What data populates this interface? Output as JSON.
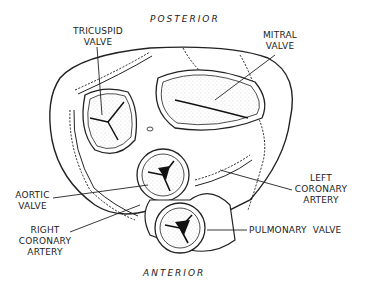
{
  "diagram": {
    "orientation": {
      "top": "POSTERIOR",
      "bottom": "ANTERIOR"
    },
    "labels": {
      "tricuspid": [
        "TRICUSPID",
        "VALVE"
      ],
      "mitral": [
        "MITRAL",
        "VALVE"
      ],
      "aortic": [
        "AORTIC",
        "VALVE"
      ],
      "left_coronary": [
        "LEFT",
        "CORONARY",
        "ARTERY"
      ],
      "right_coronary": [
        "RIGHT",
        "CORONARY",
        "ARTERY"
      ],
      "pulmonary": "PULMONARY  VALVE"
    },
    "colors": {
      "ink": "#222222",
      "background": "#ffffff"
    }
  }
}
